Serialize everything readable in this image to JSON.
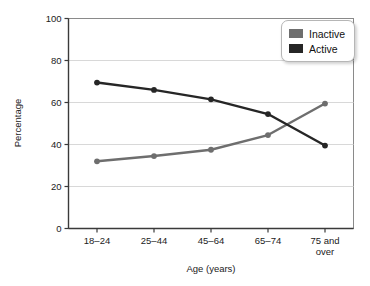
{
  "chart_data": {
    "type": "line",
    "title": "",
    "xlabel": "Age (years)",
    "ylabel": "Percentage",
    "categories": [
      "18–24",
      "25–44",
      "45–64",
      "65–74",
      "75 and over"
    ],
    "category_lines": [
      [
        "18–24"
      ],
      [
        "25–44"
      ],
      [
        "45–64"
      ],
      [
        "65–74"
      ],
      [
        "75 and",
        "over"
      ]
    ],
    "series": [
      {
        "name": "Inactive",
        "color": "#6e6e6e",
        "values": [
          32,
          34.5,
          37.5,
          44.5,
          59.5
        ]
      },
      {
        "name": "Active",
        "color": "#262626",
        "values": [
          69.5,
          66,
          61.5,
          54.5,
          39.5
        ]
      }
    ],
    "ylim": [
      0,
      100
    ],
    "yticks": [
      0,
      20,
      40,
      60,
      80,
      100
    ],
    "ytick_labels": [
      "0",
      "20",
      "40",
      "60",
      "80",
      "100"
    ],
    "grid": true,
    "grid_axis": "y",
    "legend_position": "top-right"
  },
  "legend": {
    "entries": [
      {
        "label": "Inactive",
        "color": "#6e6e6e"
      },
      {
        "label": "Active",
        "color": "#262626"
      }
    ]
  },
  "axes": {
    "y_title": "Percentage",
    "x_title": "Age (years)"
  },
  "colors": {
    "inactive": "#6e6e6e",
    "active": "#262626",
    "grid": "#d8d8d8",
    "axis": "#3a3a3a",
    "background": "#ffffff"
  }
}
